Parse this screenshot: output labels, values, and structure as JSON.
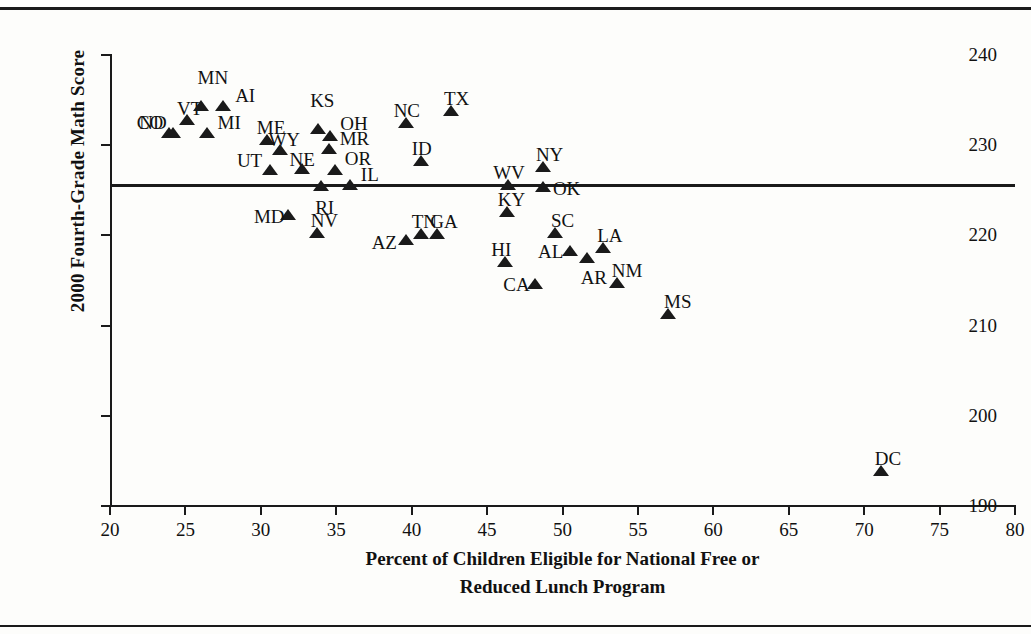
{
  "chart_data": {
    "type": "scatter",
    "title": "",
    "xlabel": "Percent of Children Eligible for National Free or Reduced Lunch Program",
    "xlabel_line1": "Percent of Children Eligible for National Free or",
    "xlabel_line2": "Reduced Lunch Program",
    "ylabel": "2000 Fourth-Grade Math Score",
    "xlim": [
      20,
      80
    ],
    "ylim": [
      190,
      240
    ],
    "xticks": [
      20,
      25,
      30,
      35,
      40,
      45,
      50,
      55,
      60,
      65,
      70,
      75,
      80
    ],
    "yticks": [
      190,
      200,
      210,
      220,
      230,
      240
    ],
    "grid": false,
    "legend": "none",
    "marker": "triangle-up",
    "marker_color": "#1a1a1a",
    "reference_line": {
      "orientation": "horizontal",
      "y": 225.6,
      "label": ""
    },
    "points": [
      {
        "label": "CO",
        "x": 23.9,
        "y": 231.4,
        "lx": -32,
        "ly": -20
      },
      {
        "label": "VT",
        "x": 25.1,
        "y": 232.8,
        "lx": -10,
        "ly": -21
      },
      {
        "label": "MN",
        "x": 26.0,
        "y": 234.3,
        "lx": -3,
        "ly": -38
      },
      {
        "label": "AI",
        "x": 27.5,
        "y": 234.3,
        "lx": 12,
        "ly": -20
      },
      {
        "label": "ND",
        "x": 24.2,
        "y": 231.4,
        "lx": -34,
        "ly": -20
      },
      {
        "label": "MI",
        "x": 26.4,
        "y": 231.4,
        "lx": 11,
        "ly": -20
      },
      {
        "label": "ME",
        "x": 30.4,
        "y": 230.6,
        "lx": -10,
        "ly": -22
      },
      {
        "label": "KS",
        "x": 33.8,
        "y": 231.8,
        "lx": -8,
        "ly": -38
      },
      {
        "label": "OH",
        "x": 34.6,
        "y": 231.0,
        "lx": 10,
        "ly": -22
      },
      {
        "label": "WY",
        "x": 31.3,
        "y": 229.5,
        "lx": -12,
        "ly": -20
      },
      {
        "label": "MR",
        "x": 34.5,
        "y": 229.6,
        "lx": 11,
        "ly": -20
      },
      {
        "label": "UT",
        "x": 30.6,
        "y": 227.3,
        "lx": -33,
        "ly": -19
      },
      {
        "label": "NE",
        "x": 32.7,
        "y": 227.4,
        "lx": -12,
        "ly": -19
      },
      {
        "label": "OR",
        "x": 34.9,
        "y": 227.2,
        "lx": 10,
        "ly": -21
      },
      {
        "label": "IL",
        "x": 35.9,
        "y": 225.6,
        "lx": 11,
        "ly": -20
      },
      {
        "label": "RI",
        "x": 34.0,
        "y": 225.5,
        "lx": -6,
        "ly": 12
      },
      {
        "label": "MD",
        "x": 31.8,
        "y": 222.3,
        "lx": -34,
        "ly": -8
      },
      {
        "label": "NV",
        "x": 33.7,
        "y": 220.3,
        "lx": -6,
        "ly": -22
      },
      {
        "label": "AZ",
        "x": 39.6,
        "y": 219.5,
        "lx": -34,
        "ly": -7
      },
      {
        "label": "TN",
        "x": 40.6,
        "y": 220.1,
        "lx": -9,
        "ly": -22
      },
      {
        "label": "GA",
        "x": 41.7,
        "y": 220.1,
        "lx": -7,
        "ly": -22
      },
      {
        "label": "NC",
        "x": 39.6,
        "y": 232.5,
        "lx": -12,
        "ly": -22
      },
      {
        "label": "TX",
        "x": 42.6,
        "y": 233.8,
        "lx": -7,
        "ly": -22
      },
      {
        "label": "ID",
        "x": 40.6,
        "y": 228.2,
        "lx": -9,
        "ly": -22
      },
      {
        "label": "WV",
        "x": 46.4,
        "y": 225.6,
        "lx": -15,
        "ly": -22
      },
      {
        "label": "NY",
        "x": 48.7,
        "y": 227.6,
        "lx": -7,
        "ly": -22
      },
      {
        "label": "OK",
        "x": 48.7,
        "y": 225.4,
        "lx": 10,
        "ly": -8
      },
      {
        "label": "KY",
        "x": 46.3,
        "y": 222.6,
        "lx": -9,
        "ly": -22
      },
      {
        "label": "SC",
        "x": 49.5,
        "y": 220.3,
        "lx": -4,
        "ly": -22
      },
      {
        "label": "AL",
        "x": 50.5,
        "y": 218.3,
        "lx": -32,
        "ly": -9
      },
      {
        "label": "AR",
        "x": 51.6,
        "y": 217.5,
        "lx": -6,
        "ly": 10
      },
      {
        "label": "HI",
        "x": 46.2,
        "y": 217.1,
        "lx": -14,
        "ly": -22
      },
      {
        "label": "CA",
        "x": 48.2,
        "y": 214.6,
        "lx": -32,
        "ly": -9
      },
      {
        "label": "LA",
        "x": 52.7,
        "y": 218.6,
        "lx": -6,
        "ly": -22
      },
      {
        "label": "NM",
        "x": 53.6,
        "y": 214.7,
        "lx": -5,
        "ly": -22
      },
      {
        "label": "MS",
        "x": 57.0,
        "y": 211.3,
        "lx": -4,
        "ly": -22
      },
      {
        "label": "DC",
        "x": 71.1,
        "y": 193.9,
        "lx": -6,
        "ly": -22
      }
    ]
  }
}
